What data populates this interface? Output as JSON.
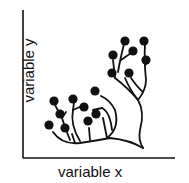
{
  "diagram": {
    "xlabel": "variable x",
    "ylabel": "variable y",
    "colors": {
      "ink": "#111111",
      "background": "#ffffff"
    },
    "leaves": [
      [
        49,
        125
      ],
      [
        60,
        114
      ],
      [
        54,
        101
      ],
      [
        73,
        99
      ],
      [
        65,
        130
      ],
      [
        84,
        107
      ],
      [
        88,
        123
      ],
      [
        96,
        115
      ],
      [
        95,
        91
      ],
      [
        125,
        41
      ],
      [
        144,
        41
      ],
      [
        133,
        51
      ],
      [
        113,
        55
      ],
      [
        146,
        60
      ],
      [
        112,
        72
      ],
      [
        130,
        72
      ]
    ]
  }
}
